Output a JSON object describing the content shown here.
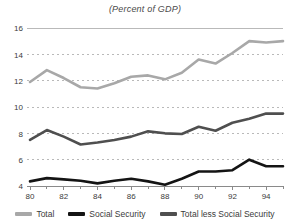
{
  "chart_data": {
    "type": "line",
    "title": "(Percent of GDP)",
    "xlabel": "",
    "ylabel": "",
    "xlim": [
      80,
      95
    ],
    "ylim": [
      4,
      16
    ],
    "ytick_values": [
      4,
      6,
      8,
      10,
      12,
      14,
      16
    ],
    "ytick_labels": [
      "4",
      "6",
      "8",
      "10",
      "12",
      "14",
      "16"
    ],
    "xtick_values": [
      80,
      81,
      82,
      83,
      84,
      85,
      86,
      87,
      88,
      89,
      90,
      91,
      92,
      93,
      94,
      95
    ],
    "xtick_labels": [
      "80",
      "",
      "82",
      "",
      "84",
      "",
      "86",
      "",
      "88",
      "",
      "90",
      "",
      "92",
      "",
      "94",
      ""
    ],
    "grid": "horizontal-dashed",
    "legend_position": "bottom",
    "x": [
      80,
      81,
      82,
      83,
      84,
      85,
      86,
      87,
      88,
      89,
      90,
      91,
      92,
      93,
      94,
      95
    ],
    "series": [
      {
        "name": "Total",
        "color": "#a8a8a8",
        "values": [
          11.9,
          12.8,
          12.2,
          11.5,
          11.4,
          11.8,
          12.3,
          12.4,
          12.1,
          12.6,
          13.6,
          13.3,
          14.1,
          15.0,
          14.9,
          15.0
        ]
      },
      {
        "name": "Social Security",
        "color": "#141414",
        "values": [
          4.35,
          4.6,
          4.5,
          4.4,
          4.2,
          4.4,
          4.55,
          4.35,
          4.1,
          4.55,
          5.1,
          5.1,
          5.2,
          6.0,
          5.5,
          5.5
        ]
      },
      {
        "name": "Total less Social Security",
        "color": "#4f4f4f",
        "values": [
          7.5,
          8.25,
          7.75,
          7.15,
          7.3,
          7.5,
          7.75,
          8.15,
          8.0,
          7.95,
          8.5,
          8.2,
          8.8,
          9.1,
          9.5,
          9.5
        ]
      }
    ]
  },
  "legend": {
    "items": [
      {
        "label": "Total",
        "color": "#a8a8a8"
      },
      {
        "label": "Social Security",
        "color": "#141414"
      },
      {
        "label": "Total less Social Security",
        "color": "#4f4f4f"
      }
    ]
  },
  "axis_style": {
    "tick_color": "#8a8a8a",
    "label_color": "#3b3b3b",
    "grid_color": "#b9b9b9",
    "top_rule_color": "#b9b9b9"
  }
}
